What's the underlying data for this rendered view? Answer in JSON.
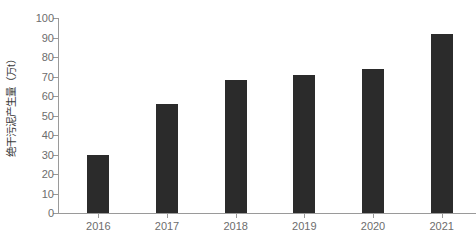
{
  "chart_data": {
    "type": "bar",
    "title": "",
    "subtitle": "",
    "xlabel": "",
    "ylabel": "绝干污泥产生量（万t）",
    "categories": [
      "2016",
      "2017",
      "2018",
      "2019",
      "2020",
      "2021"
    ],
    "values": [
      30,
      56,
      68,
      71,
      74,
      92
    ],
    "series": [
      {
        "name": "绝干污泥产生量",
        "values": [
          30,
          56,
          68,
          71,
          74,
          92
        ]
      }
    ],
    "ylim": [
      0,
      100
    ],
    "y_ticks": [
      0,
      10,
      20,
      30,
      40,
      50,
      60,
      70,
      80,
      90,
      100
    ],
    "y_tick_labels": [
      "0",
      "10",
      "20",
      "30",
      "40",
      "50",
      "60",
      "70",
      "80",
      "90",
      "100"
    ],
    "x_tick_labels": [
      "2016",
      "2017",
      "2018",
      "2019",
      "2020",
      "2021"
    ],
    "grid": false,
    "legend": false,
    "legend_position": "none",
    "bar_color": "#2b2b2b",
    "axis_color": "#9a9a9a",
    "tick_label_color": "#6d6d6d",
    "axis_title_color": "#3a3a3a",
    "background_color": "#ffffff",
    "annotations": []
  }
}
